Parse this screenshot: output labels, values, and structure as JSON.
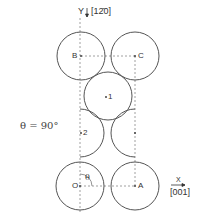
{
  "figure": {
    "condition_label": "θ = 90°",
    "y_axis": {
      "letter": "Y",
      "direction": "[12̄0]"
    },
    "x_axis": {
      "letter": "X",
      "direction": "[001]"
    },
    "points": {
      "B": "B",
      "C": "C",
      "O": "O",
      "A": "A",
      "site1": "1",
      "site2": "2",
      "angle": "θ"
    },
    "stroke_color": "#555555",
    "dash_color": "#888888"
  }
}
